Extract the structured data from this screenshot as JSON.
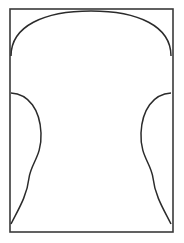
{
  "document": {
    "type": "line-drawing",
    "title": "Rounded-arch outline figure",
    "background_color": "#ffffff",
    "width": 184,
    "height": 243
  },
  "drawing": {
    "stroke_color": "#2b2b2b",
    "frame_stroke_color": "#3a3a3a",
    "stroke_width": 1.5,
    "frame_stroke_width": 1.6,
    "fill": "none",
    "symmetry": "vertical mirror about x = 91",
    "elements": [
      {
        "name": "outer-frame",
        "shape": "rectangle",
        "x": 10,
        "y": 9,
        "width": 163,
        "height": 223
      },
      {
        "name": "top-arch-curve",
        "shape": "arch",
        "left_endpoint": [
          11,
          56
        ],
        "apex": [
          91,
          11
        ],
        "right_endpoint": [
          171,
          56
        ],
        "path": "M 11 56 C 11 26 44 11 91 11 C 138 11 171 26 171 56"
      },
      {
        "name": "left-s-curve",
        "shape": "s-curve",
        "top_endpoint": [
          11,
          93
        ],
        "bulge_peak": [
          41,
          133
        ],
        "inflection": [
          30,
          177
        ],
        "bottom_endpoint": [
          11,
          224
        ],
        "path": "M 11 93 C 29 94 40 110 41 133 C 42 156 31 163 29 178 C 27 196 18 210 11 224"
      },
      {
        "name": "right-s-curve",
        "shape": "s-curve",
        "top_endpoint": [
          171,
          93
        ],
        "bulge_peak": [
          141,
          133
        ],
        "inflection": [
          152,
          177
        ],
        "bottom_endpoint": [
          171,
          224
        ],
        "path": "M 171 93 C 153 94 142 110 141 133 C 140 156 151 163 153 178 C 155 196 164 210 171 224"
      }
    ]
  }
}
